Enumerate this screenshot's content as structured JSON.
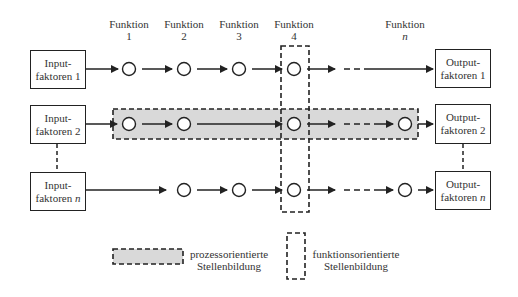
{
  "functions": [
    {
      "label": "Funktion",
      "num": "1"
    },
    {
      "label": "Funktion",
      "num": "2"
    },
    {
      "label": "Funktion",
      "num": "3"
    },
    {
      "label": "Funktion",
      "num": "4"
    },
    {
      "label": "Funktion",
      "num": "n"
    }
  ],
  "inputs": [
    {
      "line1": "Input-",
      "line2": "faktoren 1"
    },
    {
      "line1": "Input-",
      "line2": "faktoren 2"
    },
    {
      "line1": "Input-",
      "line2": "faktoren",
      "suffix": "n"
    }
  ],
  "outputs": [
    {
      "line1": "Output-",
      "line2": "faktoren 1"
    },
    {
      "line1": "Output-",
      "line2": "faktoren 2"
    },
    {
      "line1": "Output-",
      "line2": "faktoren",
      "suffix": "n"
    }
  ],
  "legend": {
    "process": {
      "line1": "prozessorientierte",
      "line2": "Stellenbildung"
    },
    "function": {
      "line1": "funktionsorientierte",
      "line2": "Stellenbildung"
    }
  },
  "colors": {
    "highlight_fill": "#d9d9d9",
    "stroke": "#222222"
  }
}
